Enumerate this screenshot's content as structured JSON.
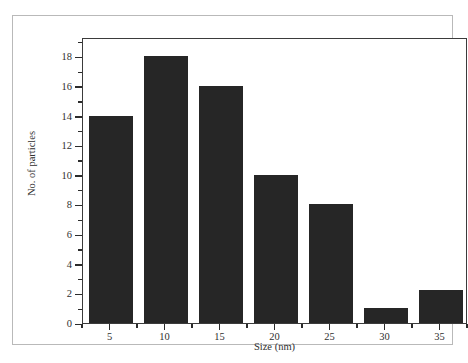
{
  "chart_data": {
    "type": "bar",
    "title": "",
    "subtitle": "",
    "xlabel": "Size (nm)",
    "ylabel": "No. of particles",
    "categories": [
      "5",
      "10",
      "15",
      "20",
      "25",
      "30",
      "35"
    ],
    "x": [
      5,
      10,
      15,
      20,
      25,
      30,
      35
    ],
    "values": [
      14,
      18,
      16,
      10,
      8,
      1,
      2.2
    ],
    "series": [
      {
        "name": "No. of particles",
        "values": [
          14,
          18,
          16,
          10,
          8,
          1,
          2.2
        ]
      }
    ],
    "xlim": [
      2.5,
      37.5
    ],
    "ylim": [
      0,
      19.3
    ],
    "x_ticks": [
      5,
      10,
      15,
      20,
      25,
      30,
      35
    ],
    "x_tick_labels": [
      "5",
      "10",
      "15",
      "20",
      "25",
      "30",
      "35"
    ],
    "x_minor_ticks": [
      2.5,
      7.5,
      12.5,
      17.5,
      22.5,
      27.5,
      32.5,
      37.5
    ],
    "y_ticks": [
      0,
      2,
      4,
      6,
      8,
      10,
      12,
      14,
      16,
      18
    ],
    "y_tick_labels": [
      "0",
      "2",
      "4",
      "6",
      "8",
      "10",
      "12",
      "14",
      "16",
      "18"
    ],
    "y_minor_ticks": [
      1,
      3,
      5,
      7,
      9,
      11,
      13,
      15,
      17,
      19
    ],
    "grid": false,
    "legend": false,
    "legend_position": "none",
    "bar_color": "#262626",
    "axis_color": "#3b3b3b",
    "background_color": "#ffffff",
    "frame_color": "#b9b9b9",
    "bar_width_nm": 4.0
  }
}
